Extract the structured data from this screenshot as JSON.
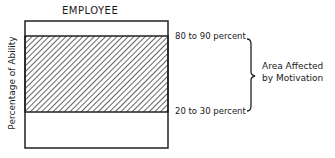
{
  "diagram": {
    "title": "EMPLOYEE",
    "y_axis_label": "Percentage of Ability",
    "upper_bound_label": "80 to 90 percent",
    "lower_bound_label": "20 to 30 percent",
    "bracket_label_line1": "Area Affected",
    "bracket_label_line2": "by Motivation",
    "hatched_region": {
      "from_percent_range": "20-30",
      "to_percent_range": "80-90"
    }
  }
}
